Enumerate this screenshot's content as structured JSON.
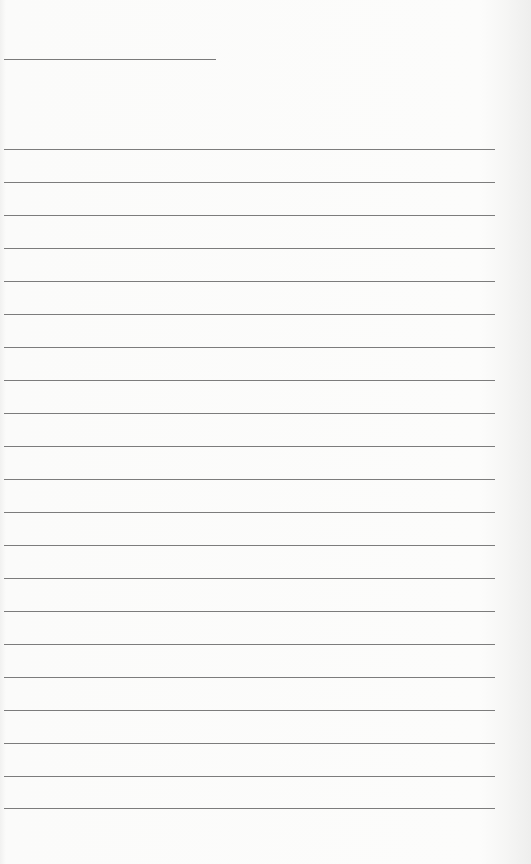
{
  "page": {
    "type": "lined-form",
    "background_color": "#f7f7f6",
    "line_color": "#7c7c7c",
    "header_line": {
      "x": 4,
      "y": 59,
      "width": 212
    },
    "rules": {
      "x": 4,
      "width": 491,
      "positions": [
        149,
        182,
        215,
        248,
        281,
        314,
        347,
        380,
        413,
        446,
        479,
        512,
        545,
        578,
        611,
        644,
        677,
        710,
        743,
        776,
        808
      ]
    }
  }
}
